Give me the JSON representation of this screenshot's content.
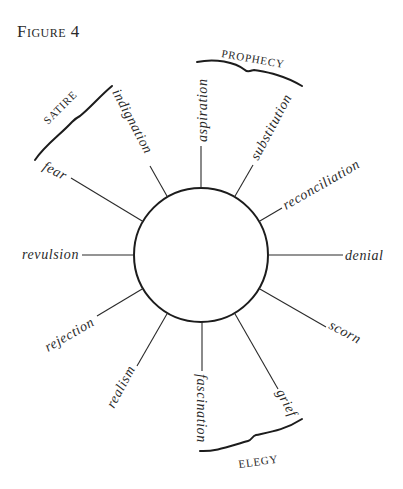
{
  "figure": {
    "title": "Figure 4"
  },
  "diagram": {
    "center_label": "",
    "spokes": [
      {
        "label": "aspiration"
      },
      {
        "label": "substitution"
      },
      {
        "label": "reconciliation"
      },
      {
        "label": "denial"
      },
      {
        "label": "scorn"
      },
      {
        "label": "grief"
      },
      {
        "label": "fascination"
      },
      {
        "label": "realism"
      },
      {
        "label": "rejection"
      },
      {
        "label": "revulsion"
      },
      {
        "label": "fear"
      },
      {
        "label": "indignation"
      }
    ],
    "groups": [
      {
        "label": "PROPHECY",
        "spans": [
          "aspiration",
          "substitution"
        ]
      },
      {
        "label": "ELEGY",
        "spans": [
          "fascination",
          "grief"
        ]
      },
      {
        "label": "SATIRE",
        "spans": [
          "fear",
          "indignation"
        ]
      }
    ]
  }
}
